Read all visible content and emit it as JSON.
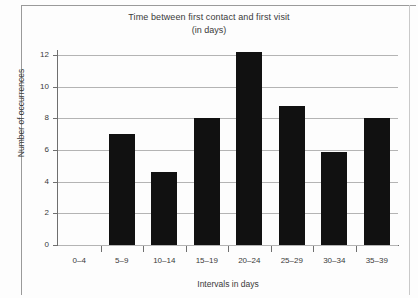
{
  "chart_data": {
    "type": "bar",
    "title": "Time between first contact and first visit",
    "subtitle": "(in days)",
    "xlabel": "Intervals in days",
    "ylabel": "Number of occurrences",
    "categories": [
      "0–4",
      "5–9",
      "10–14",
      "15–19",
      "20–24",
      "25–29",
      "30–34",
      "35–39"
    ],
    "values": [
      0,
      7.0,
      4.6,
      8.0,
      12.2,
      8.8,
      5.9,
      8.0
    ],
    "ylim": [
      0,
      12.6
    ],
    "yticks": [
      0,
      2,
      4,
      6,
      8,
      10,
      12
    ],
    "ytick_labels": [
      "0",
      "2",
      "4",
      "6",
      "8",
      "10",
      "12"
    ],
    "grid": true,
    "legend": false,
    "bar_color": "#111111",
    "grid_color": "#b4b4b4",
    "axis_color": "#6f6f6f",
    "background_color": "#fdfdfd"
  }
}
